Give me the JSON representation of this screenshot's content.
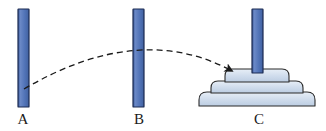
{
  "figure": {
    "width": 326,
    "height": 131,
    "background_color": "#ffffff"
  },
  "colors": {
    "peg_fill": "#5274b8",
    "peg_fill_light": "#6d8bc6",
    "peg_outline": "#1b2a52",
    "disk_fill": "#c9d6e8",
    "disk_fill_light": "#e2eaf4",
    "disk_outline": "#2b2b2b",
    "arrow_color": "#1a1a1a",
    "label_color": "#1b1b1b"
  },
  "pegs": [
    {
      "id": "a",
      "label": "A",
      "x": 18,
      "y": 9,
      "width": 11,
      "height": 98,
      "disk_count": 0
    },
    {
      "id": "b",
      "label": "B",
      "x": 133,
      "y": 9,
      "width": 11,
      "height": 98,
      "disk_count": 0
    },
    {
      "id": "c",
      "label": "C",
      "x": 252,
      "y": 9,
      "width": 11,
      "height": 98,
      "disk_count": 3
    }
  ],
  "disks": [
    {
      "index": 1,
      "size": "small",
      "cx": 257,
      "top": 69,
      "width": 64,
      "height": 13,
      "corner_radius": 7
    },
    {
      "index": 2,
      "size": "medium",
      "cx": 257,
      "top": 81,
      "width": 92,
      "height": 12,
      "corner_radius": 7
    },
    {
      "index": 3,
      "size": "large",
      "cx": 257,
      "top": 92,
      "width": 116,
      "height": 14,
      "corner_radius": 8
    }
  ],
  "move_arrow": {
    "name": "move-arrow",
    "style": "dashed-curve-with-arrowhead",
    "from_peg": "A",
    "to_peg": "C",
    "start": {
      "x": 24,
      "y": 89
    },
    "control": {
      "x": 140,
      "y": 21
    },
    "end": {
      "x": 232,
      "y": 71
    },
    "dash_pattern": "6 4",
    "stroke_width": 1.3,
    "arrowhead_size": 9
  },
  "labels": {
    "a": "A",
    "b": "B",
    "c": "C"
  }
}
